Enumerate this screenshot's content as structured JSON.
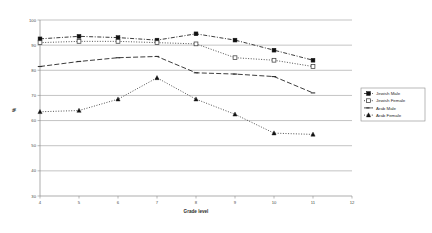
{
  "chart_data": {
    "type": "line",
    "title": "",
    "xlabel": "Grade level",
    "ylabel": "%",
    "xlim": [
      4,
      12
    ],
    "ylim": [
      30,
      100
    ],
    "xticks": [
      "4",
      "5",
      "6",
      "7",
      "8",
      "9",
      "10",
      "11",
      "12"
    ],
    "yticks": [
      "30",
      "40",
      "50",
      "60",
      "70",
      "80",
      "90",
      "100"
    ],
    "grid": "horizontal",
    "legend_position": "right",
    "x": [
      4,
      5,
      6,
      7,
      8,
      9,
      10,
      11
    ],
    "series": [
      {
        "name": "Jewish Male",
        "marker": "filled-square",
        "line": "dash-dot",
        "values": [
          92.5,
          93.5,
          93.0,
          92.0,
          94.5,
          92.0,
          88.0,
          84.0
        ]
      },
      {
        "name": "Jewish Female",
        "marker": "open-square",
        "line": "dotted",
        "values": [
          91.0,
          91.5,
          91.5,
          91.0,
          90.5,
          85.0,
          84.0,
          81.5
        ]
      },
      {
        "name": "Arab Male",
        "marker": "open-dash",
        "line": "dashed",
        "values": [
          81.5,
          83.5,
          85.0,
          85.5,
          79.0,
          78.5,
          77.5,
          71.0
        ]
      },
      {
        "name": "Arab Female",
        "marker": "filled-triangle",
        "line": "dotted",
        "values": [
          63.5,
          64.0,
          68.5,
          77.0,
          68.5,
          62.5,
          55.0,
          54.5
        ]
      }
    ]
  },
  "legend": {
    "items": [
      {
        "label": "Jewish Male"
      },
      {
        "label": "Jewish Female"
      },
      {
        "label": "Arab Male"
      },
      {
        "label": "Arab Female"
      }
    ]
  },
  "axes": {
    "x_title": "Grade level",
    "y_title": "%"
  }
}
